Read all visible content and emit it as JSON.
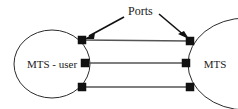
{
  "diagram": {
    "background_color": "#ffffff",
    "outline_color": "#2b2b2b",
    "port_color": "#111111",
    "connection_color": "#555555",
    "annotation": {
      "label": "Ports",
      "x": 128,
      "y": 15,
      "font_size": 12
    },
    "entities": [
      {
        "id": "mts-user",
        "label": "MTS - user",
        "shape": "ellipse",
        "cx": 52,
        "cy": 64,
        "rx": 38,
        "ry": 34,
        "label_x": 52,
        "label_y": 68,
        "font_size": 11,
        "clipped": false
      },
      {
        "id": "mts",
        "label": "MTS",
        "shape": "ellipse",
        "cx": 246,
        "cy": 64,
        "rx": 58,
        "ry": 46,
        "label_x": 215,
        "label_y": 68,
        "font_size": 11,
        "clipped": true
      }
    ],
    "ports": [
      {
        "id": "port-left-top",
        "side": "left",
        "x": 82,
        "y": 40,
        "size": 8
      },
      {
        "id": "port-left-middle",
        "side": "left",
        "x": 85,
        "y": 63,
        "size": 8
      },
      {
        "id": "port-left-bottom",
        "side": "left",
        "x": 82,
        "y": 87,
        "size": 8
      },
      {
        "id": "port-right-top",
        "side": "right",
        "x": 190,
        "y": 41,
        "size": 8
      },
      {
        "id": "port-right-middle",
        "side": "right",
        "x": 186,
        "y": 63,
        "size": 8
      },
      {
        "id": "port-right-bottom",
        "side": "right",
        "x": 190,
        "y": 87,
        "size": 8
      }
    ],
    "connections": [
      {
        "id": "connection-top",
        "x1": 82,
        "y1": 40,
        "x2": 190,
        "y2": 41
      },
      {
        "id": "connection-middle",
        "x1": 85,
        "y1": 63,
        "x2": 186,
        "y2": 63
      },
      {
        "id": "connection-bottom",
        "x1": 82,
        "y1": 87,
        "x2": 190,
        "y2": 87
      }
    ],
    "leaders": [
      {
        "id": "leader-left",
        "from_x": 124,
        "from_y": 17,
        "to_x": 85,
        "to_y": 38,
        "target": "port-left-top"
      },
      {
        "id": "leader-right",
        "from_x": 159,
        "from_y": 14,
        "to_x": 188,
        "to_y": 38,
        "target": "port-right-top"
      }
    ]
  }
}
